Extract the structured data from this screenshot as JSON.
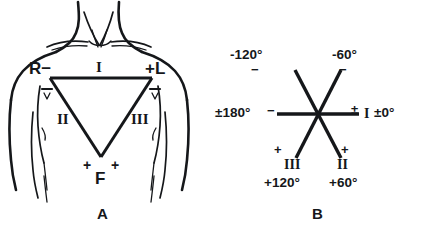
{
  "figure": {
    "ink_color": "#15171a",
    "background": "#ffffff"
  },
  "panel_a": {
    "caption": "A",
    "name": "einthoven-triangle-on-torso",
    "vertices": {
      "right_arm": {
        "label": "R",
        "polarity": "−",
        "secondary_polarity": "−"
      },
      "left_arm": {
        "polarity": "+",
        "label": "L",
        "secondary_polarity": "−"
      },
      "foot": {
        "label": "F",
        "polarity_left": "+",
        "polarity_right": "+"
      }
    },
    "leads": {
      "lead_I": "I",
      "lead_II": "II",
      "lead_III": "III"
    }
  },
  "panel_b": {
    "caption": "B",
    "name": "hexaxial-reference-system",
    "axes": [
      {
        "lead": "I",
        "degrees": "±0°",
        "polarity": "±",
        "position": "right"
      },
      {
        "lead": "",
        "degrees": "±180°",
        "polarity": "−",
        "position": "left"
      },
      {
        "lead": "",
        "degrees": "-120°",
        "polarity": "−",
        "position": "upper-left"
      },
      {
        "lead": "",
        "degrees": "-60°",
        "polarity": "−",
        "position": "upper-right"
      },
      {
        "lead": "III",
        "degrees": "+120°",
        "polarity": "+",
        "position": "lower-left"
      },
      {
        "lead": "II",
        "degrees": "+60°",
        "polarity": "+",
        "position": "lower-right"
      }
    ],
    "labels": {
      "deg_minus_120": "-120°",
      "deg_minus_60": "-60°",
      "deg_plus_180": "±180°",
      "deg_zero": "±0°",
      "deg_plus_120": "+120°",
      "deg_plus_60": "+60°",
      "lead_I": "I",
      "lead_II": "II",
      "lead_III": "III",
      "sign_minus": "−",
      "sign_plus": "+",
      "sign_plusminus": "±"
    }
  }
}
